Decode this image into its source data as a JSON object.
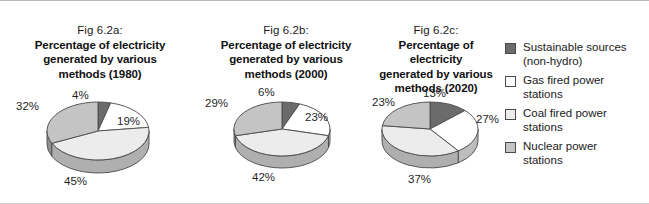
{
  "chart_data": [
    {
      "type": "pie",
      "title": "Percentage of electricity generated by various methods (1980)",
      "fig_number": "Fig 6.2a:",
      "title_line1": "Percentage of electricity",
      "title_line2": "generated by various",
      "title_line3": "methods (1980)",
      "categories": [
        "Sustainable sources (non-hydro)",
        "Gas fired power stations",
        "Coal fired power stations",
        "Nuclear power stations"
      ],
      "values": [
        4,
        45,
        19,
        32
      ],
      "slice_order_clockwise_from_top": [
        {
          "label": "4%",
          "value": 4,
          "category": "Sustainable sources (non-hydro)",
          "color": "#6b6b6b"
        },
        {
          "label": "19%",
          "value": 19,
          "category": "Gas fired power stations",
          "color": "#ffffff"
        },
        {
          "label": "45%",
          "value": 45,
          "category": "Coal fired power stations",
          "color": "#ececec"
        },
        {
          "label": "32%",
          "value": 32,
          "category": "Nuclear power stations",
          "color": "#c4c4c4"
        }
      ]
    },
    {
      "type": "pie",
      "title": "Percentage of electricity generated by various methods (2000)",
      "fig_number": "Fig 6.2b:",
      "title_line1": "Percentage of electricity",
      "title_line2": "generated by various",
      "title_line3": "methods (2000)",
      "categories": [
        "Sustainable sources (non-hydro)",
        "Gas fired power stations",
        "Coal fired power stations",
        "Nuclear power stations"
      ],
      "values": [
        6,
        42,
        23,
        29
      ],
      "slice_order_clockwise_from_top": [
        {
          "label": "6%",
          "value": 6,
          "category": "Sustainable sources (non-hydro)",
          "color": "#6b6b6b"
        },
        {
          "label": "23%",
          "value": 23,
          "category": "Gas fired power stations",
          "color": "#ffffff"
        },
        {
          "label": "42%",
          "value": 42,
          "category": "Coal fired power stations",
          "color": "#ececec"
        },
        {
          "label": "29%",
          "value": 29,
          "category": "Nuclear power stations",
          "color": "#c4c4c4"
        }
      ]
    },
    {
      "type": "pie",
      "title": "Percentage of electricity generated by various methods (2020)",
      "fig_number": "Fig 6.2c:",
      "title_line1": "Percentage of electricity",
      "title_line2": "generated by various",
      "title_line3": "methods (2020)",
      "categories": [
        "Sustainable sources (non-hydro)",
        "Gas fired power stations",
        "Coal fired power stations",
        "Nuclear power stations"
      ],
      "values": [
        13,
        37,
        27,
        23
      ],
      "slice_order_clockwise_from_top": [
        {
          "label": "13%",
          "value": 13,
          "category": "Sustainable sources (non-hydro)",
          "color": "#6b6b6b"
        },
        {
          "label": "27%",
          "value": 27,
          "category": "Gas fired power stations",
          "color": "#ffffff"
        },
        {
          "label": "37%",
          "value": 37,
          "category": "Coal fired power stations",
          "color": "#ececec"
        },
        {
          "label": "23%",
          "value": 23,
          "category": "Nuclear power stations",
          "color": "#c4c4c4"
        }
      ]
    }
  ],
  "figures": {
    "a": {
      "fig_number": "Fig 6.2a:",
      "title_line1": "Percentage of electricity",
      "title_line2": "generated by various",
      "title_line3": "methods (1980)",
      "labels": {
        "top": "4%",
        "right": "19%",
        "bottom": "45%",
        "left": "32%"
      }
    },
    "b": {
      "fig_number": "Fig 6.2b:",
      "title_line1": "Percentage of electricity",
      "title_line2": "generated by various",
      "title_line3": "methods (2000)",
      "labels": {
        "top": "6%",
        "right": "23%",
        "bottom": "42%",
        "left": "29%"
      }
    },
    "c": {
      "fig_number": "Fig 6.2c:",
      "title_line1": "Percentage of electricity",
      "title_line2": "generated by various",
      "title_line3": "methods (2020)",
      "labels": {
        "top": "13%",
        "right": "27%",
        "bottom": "37%",
        "left": "23%"
      }
    }
  },
  "legend": {
    "position": "right",
    "items": [
      {
        "line1": "Sustainable sources",
        "line2": "(non-hydro)",
        "color": "#6b6b6b",
        "swatch": "dark-gray"
      },
      {
        "line1": "Gas fired power",
        "line2": "stations",
        "color": "#ffffff",
        "swatch": "white"
      },
      {
        "line1": "Coal fired power",
        "line2": "stations",
        "color": "#ececec",
        "swatch": "very-light-gray"
      },
      {
        "line1": "Nuclear power",
        "line2": "stations",
        "color": "#c4c4c4",
        "swatch": "medium-gray"
      }
    ]
  },
  "colors": {
    "sustainable": "#6b6b6b",
    "gas": "#ffffff",
    "coal": "#ececec",
    "nuclear": "#c4c4c4",
    "outline": "#4a4a4a",
    "depth_shadow": "#8f8f8f",
    "text": "#1a1a1a",
    "background": "#ffffff"
  }
}
